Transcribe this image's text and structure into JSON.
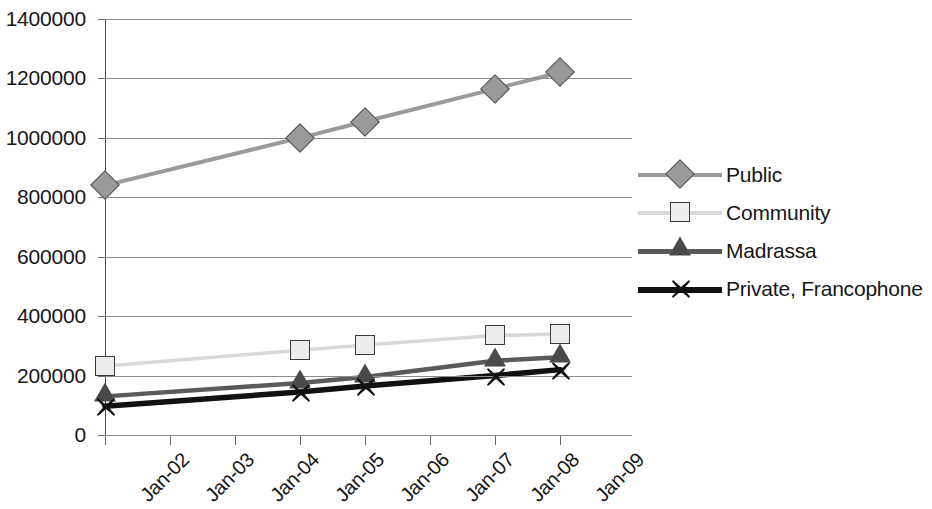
{
  "chart_data": {
    "type": "line",
    "title": "",
    "subtitle": "",
    "xlabel": "",
    "ylabel": "",
    "x": [
      "Jan-02",
      "Jan-03",
      "Jan-04",
      "Jan-05",
      "Jan-06",
      "Jan-07",
      "Jan-08",
      "Jan-09"
    ],
    "xtick_labels": [
      "Jan-02",
      "Jan-03",
      "Jan-04",
      "Jan-05",
      "Jan-06",
      "Jan-07",
      "Jan-08",
      "Jan-09"
    ],
    "ytick_labels": [
      "1400000",
      "1200000",
      "1000000",
      "800000",
      "600000",
      "400000",
      "200000",
      "0"
    ],
    "ytick_values": [
      1400000,
      1200000,
      1000000,
      800000,
      600000,
      400000,
      200000,
      0
    ],
    "ylim": [
      0,
      1400000
    ],
    "grid": "horizontal",
    "legend_position": "right",
    "series": [
      {
        "name": "Public",
        "marker": "diamond",
        "color": "#9a9a9a",
        "line_color": "#9a9a9a",
        "marker_points": [
          "Jan-02",
          "Jan-05",
          "Jan-06",
          "Jan-08",
          "Jan-09"
        ],
        "values": [
          840000,
          null,
          null,
          1000000,
          1055000,
          null,
          1165000,
          1220000
        ]
      },
      {
        "name": "Community",
        "marker": "square",
        "color": "#ececec",
        "line_color": "#d8d8d8",
        "marker_points": [
          "Jan-02",
          "Jan-05",
          "Jan-06",
          "Jan-08",
          "Jan-09"
        ],
        "values": [
          232000,
          null,
          null,
          285000,
          303000,
          null,
          335000,
          340000
        ]
      },
      {
        "name": "Madrassa",
        "marker": "triangle",
        "color": "#4a4a4a",
        "line_color": "#5a5a5a",
        "marker_points": [
          "Jan-02",
          "Jan-05",
          "Jan-06",
          "Jan-08",
          "Jan-09"
        ],
        "values": [
          130000,
          null,
          null,
          175000,
          195000,
          null,
          250000,
          262000
        ]
      },
      {
        "name": "Private, Francophone",
        "marker": "x",
        "color": "#111111",
        "line_color": "#111111",
        "marker_points": [
          "Jan-02",
          "Jan-05",
          "Jan-06",
          "Jan-08",
          "Jan-09"
        ],
        "values": [
          97000,
          null,
          null,
          145000,
          165000,
          null,
          200000,
          220000
        ]
      }
    ]
  },
  "legend": {
    "items": [
      {
        "label": "Public"
      },
      {
        "label": "Community"
      },
      {
        "label": "Madrassa"
      },
      {
        "label": "Private, Francophone"
      }
    ]
  }
}
